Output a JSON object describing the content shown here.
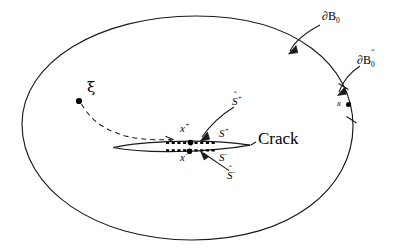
{
  "figure": {
    "kind": "mechanics-schematic",
    "background_color": "#ffffff",
    "stroke_color": "#1a1a1a",
    "caption_font": "serif"
  },
  "labels": {
    "outer_boundary": "∂B",
    "outer_boundary_sub": "0",
    "smoothed_boundary": "∂B",
    "smoothed_boundary_sub": "0",
    "smoothed_boundary_hat": "ˆ",
    "boundary_point": "x",
    "source_point": "ξ",
    "crack_point_upper": "x",
    "crack_point_upper_sup": "+",
    "crack_point_lower": "x",
    "crack_point_lower_sup": "-",
    "surface_upper": "S",
    "surface_upper_sup": "+",
    "surface_lower": "S",
    "surface_lower_sup": "-",
    "surface_hat_upper": "S",
    "surface_hat_upper_sup": "+",
    "surface_hat_upper_hat": "ˆ",
    "surface_hat_lower": "S",
    "surface_hat_lower_sup": "-",
    "surface_hat_lower_hat": "ˆ",
    "crack": "Crack"
  },
  "geometry": {
    "body_outline": "M 22,124 C 22,62 99,16 196,16 C 296,16 353,66 353,126 C 353,188 291,240 192,240 C 96,240 22,189 22,124 Z",
    "crack_lens_top": "M 113,147 C 150,140 215,139 250,145",
    "crack_lens_bottom": "M 113,147 C 150,153 215,152 250,145",
    "dashed_path": "M 70,100 C 84,126 116,140 174,140",
    "arrow_dB0": "M 318,23 C 300,31 292,42 288,52",
    "arrow_dB0hat": "M 355,64 C 342,73 337,82 335,92",
    "arrow_Shat_plus": "M 233,106 C 218,115 206,127 199,138",
    "arrow_Shat_minus": "M 228,170 C 219,164 208,156 200,152",
    "boundary_ticks": [
      {
        "x": 343,
        "y": 87,
        "angle": -28
      },
      {
        "x": 351,
        "y": 120,
        "angle": -18
      }
    ]
  }
}
